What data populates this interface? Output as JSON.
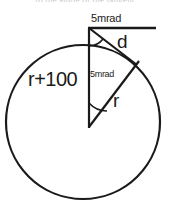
{
  "figure": {
    "type": "geometry-diagram",
    "cut_off_header_text": "to the  angle  of the  tangent",
    "labels": {
      "top_angle": "5mrad",
      "center_angle": "5mrad",
      "chord": "d",
      "outer_radius": "r+100",
      "inner_radius": "r"
    },
    "colors": {
      "stroke": "#1a1a1a",
      "text": "#1a1a1a",
      "background": "#ffffff",
      "faded_text": "#9a9a9a"
    },
    "geometry": {
      "circle": {
        "cx": 83,
        "cy": 122,
        "r": 77
      },
      "apex": {
        "x": 89,
        "y": 28
      },
      "center_vertex": {
        "x": 89,
        "y": 127
      },
      "tangent_point": {
        "x": 133,
        "y": 63
      },
      "horizontal_line_end": {
        "x": 156,
        "y": 28
      }
    }
  }
}
